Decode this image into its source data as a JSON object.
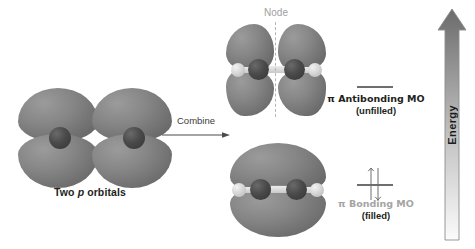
{
  "figure": {
    "background_color": "#ffffff"
  },
  "left_panel": {
    "caption_prefix": "Two ",
    "caption_italic": "p",
    "caption_suffix": " orbitals",
    "caption_full": "Two p orbitals",
    "orbital_count": 2
  },
  "combine": {
    "label": "Combine",
    "arrow_icon": "right-arrow-icon"
  },
  "node": {
    "label": "Node",
    "color": "#a0a0a0",
    "line_style": "dashed"
  },
  "antibonding": {
    "label_line1": "π Antibonding MO",
    "label_line2": "(unfilled)",
    "electron_count": 0,
    "level_color": "#6e6e6e"
  },
  "bonding": {
    "label_line1": "π Bonding MO",
    "label_line2": "(filled)",
    "electron_count": 2,
    "level_color": "#6e6e6e",
    "label_line1_color": "#a5a5a5"
  },
  "energy_axis": {
    "label": "Energy",
    "direction": "up",
    "gradient_top": "#6b6b6b",
    "gradient_bottom": "#f2f2f2"
  },
  "colors": {
    "lobe_fill": "#858585",
    "atom_dark": "#3f3f3f",
    "atom_light": "#d8d8d8",
    "text": "#231f20"
  }
}
